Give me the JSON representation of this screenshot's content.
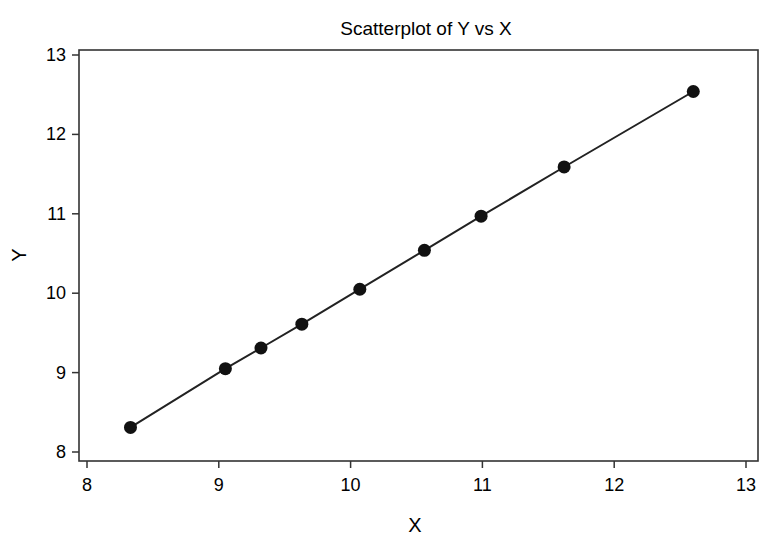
{
  "chart_data": {
    "type": "scatter",
    "title": "Scatterplot of Y vs X",
    "xlabel": "X",
    "ylabel": "Y",
    "xlim": [
      7.92,
      13.1
    ],
    "ylim": [
      7.96,
      13.07
    ],
    "xticks": [
      8,
      9,
      10,
      11,
      12,
      13
    ],
    "yticks": [
      8,
      9,
      10,
      11,
      12,
      13
    ],
    "grid": false,
    "legend": null,
    "connect_points": true,
    "series": [
      {
        "name": "Y vs X",
        "x": [
          8.33,
          9.05,
          9.32,
          9.63,
          10.07,
          10.56,
          10.99,
          11.62,
          12.6
        ],
        "y": [
          8.31,
          9.05,
          9.31,
          9.61,
          10.05,
          10.54,
          10.97,
          11.59,
          12.54
        ]
      }
    ],
    "colors": {
      "marker": "#111111",
      "line": "#222222",
      "frame": "#333333"
    }
  }
}
